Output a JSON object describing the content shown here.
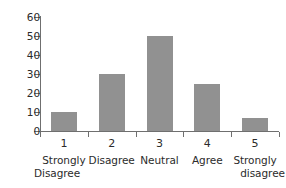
{
  "chart_data": {
    "type": "bar",
    "title": "",
    "xlabel": "",
    "ylabel": "",
    "categories": [
      "1",
      "2",
      "3",
      "4",
      "5"
    ],
    "category_labels": [
      "Strongly Disagree",
      "Disagree",
      "Neutral",
      "Agree",
      "Strongly disagree"
    ],
    "values": [
      10,
      30,
      50,
      25,
      7
    ],
    "ylim": [
      0,
      60
    ],
    "yticks": [
      0,
      10,
      20,
      30,
      40,
      50,
      60
    ],
    "ytick_labels": [
      "0",
      "10",
      "20",
      "30",
      "40",
      "50",
      "60"
    ],
    "grid": false,
    "legend": null,
    "bar_color": "#919191",
    "axis_color": "#6f6f6f",
    "background": "#ffffff"
  },
  "axis": {
    "y_tick_labels": [
      "60",
      "50",
      "40",
      "30",
      "20",
      "10",
      "0"
    ]
  },
  "bars": [
    {
      "index": "1",
      "value": 10,
      "number_label": "1",
      "text_line1": "Strongly",
      "text_line2": "Disagree"
    },
    {
      "index": "2",
      "value": 30,
      "number_label": "2",
      "text_line1": "Disagree",
      "text_line2": ""
    },
    {
      "index": "3",
      "value": 50,
      "number_label": "3",
      "text_line1": "Neutral",
      "text_line2": ""
    },
    {
      "index": "4",
      "value": 25,
      "number_label": "4",
      "text_line1": "Agree",
      "text_line2": ""
    },
    {
      "index": "5",
      "value": 7,
      "number_label": "5",
      "text_line1": "Strongly",
      "text_line2": "disagree"
    }
  ]
}
